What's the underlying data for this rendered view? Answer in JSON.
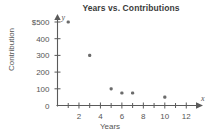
{
  "chart_data": {
    "type": "scatter",
    "title": "Years vs. Contributions",
    "xlabel": "Years",
    "ylabel": "Contribution",
    "x_axis_letter": "x",
    "y_axis_letter": "y",
    "xlim": [
      0,
      13
    ],
    "ylim": [
      0,
      550
    ],
    "grid": false,
    "legend": null,
    "x_ticks": [
      2,
      4,
      6,
      8,
      10,
      12
    ],
    "x_tick_labels": [
      "2",
      "4",
      "6",
      "8",
      "10",
      "12"
    ],
    "x_minor_ticks": [
      1,
      3,
      5,
      7,
      9,
      11,
      13
    ],
    "y_ticks": [
      0,
      100,
      200,
      300,
      400,
      500
    ],
    "y_tick_labels": [
      "0",
      "100",
      "200",
      "300",
      "400",
      "$500"
    ],
    "points": [
      {
        "x": 1,
        "y": 500
      },
      {
        "x": 3,
        "y": 300
      },
      {
        "x": 5,
        "y": 100
      },
      {
        "x": 6,
        "y": 75
      },
      {
        "x": 7,
        "y": 75
      },
      {
        "x": 10,
        "y": 50
      }
    ]
  }
}
